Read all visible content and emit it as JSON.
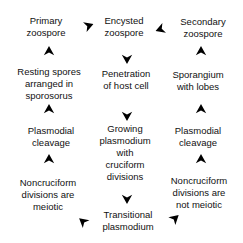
{
  "diagram": {
    "background_color": "#ffffff",
    "text_color": "#111111",
    "arrow_color": "#111111",
    "nodes": {
      "primary_zoospore": "Primary\nzoospore",
      "encysted_zoospore": "Encysted\nzoospore",
      "secondary_zoospore": "Secondary\nzoospore",
      "resting_spores": "Resting spores\narranged in\nsporosorus",
      "penetration": "Penetration\nof host cell",
      "sporangium": "Sporangium\nwith lobes",
      "plasmodial_cleavage_left": "Plasmodial\ncleavage",
      "growing_plasmodium": "Growing\nplasmodium\nwith\ncruciform\ndivisions",
      "plasmodial_cleavage_right": "Plasmodial\ncleavage",
      "noncruciform_meiotic": "Noncruciform\ndivisions are\nmeiotic",
      "noncruciform_not_meiotic": "Noncruciform\ndivisions are\nnot meiotic",
      "transitional_plasmodium": "Transitional\nplasmodium"
    },
    "edges": [
      {
        "from": "primary_zoospore",
        "to": "encysted_zoospore",
        "direction": "right"
      },
      {
        "from": "secondary_zoospore",
        "to": "encysted_zoospore",
        "direction": "left"
      },
      {
        "from": "resting_spores",
        "to": "primary_zoospore",
        "direction": "up"
      },
      {
        "from": "encysted_zoospore",
        "to": "penetration",
        "direction": "down"
      },
      {
        "from": "sporangium",
        "to": "secondary_zoospore",
        "direction": "up"
      },
      {
        "from": "plasmodial_cleavage_left",
        "to": "resting_spores",
        "direction": "up"
      },
      {
        "from": "penetration",
        "to": "growing_plasmodium",
        "direction": "down"
      },
      {
        "from": "plasmodial_cleavage_right",
        "to": "sporangium",
        "direction": "up"
      },
      {
        "from": "noncruciform_meiotic",
        "to": "plasmodial_cleavage_left",
        "direction": "up"
      },
      {
        "from": "growing_plasmodium",
        "to": "transitional_plasmodium",
        "direction": "down"
      },
      {
        "from": "noncruciform_not_meiotic",
        "to": "plasmodial_cleavage_right",
        "direction": "up"
      },
      {
        "from": "transitional_plasmodium",
        "to": "noncruciform_meiotic",
        "direction": "up-left"
      },
      {
        "from": "transitional_plasmodium",
        "to": "noncruciform_not_meiotic",
        "direction": "up-right"
      }
    ]
  }
}
